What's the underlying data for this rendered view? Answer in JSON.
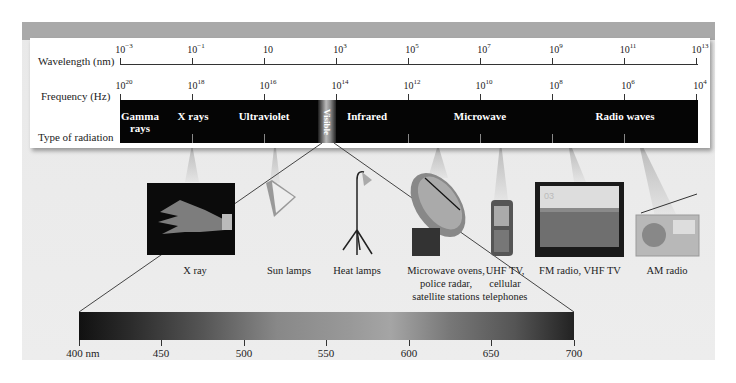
{
  "diagram": {
    "row_labels": {
      "wavelength": "Wavelength (nm)",
      "frequency": "Frequency (Hz)",
      "type": "Type of radiation"
    },
    "wavelength_ticks": [
      {
        "base": "10",
        "exp": "−3"
      },
      {
        "base": "10",
        "exp": "−1"
      },
      {
        "base": "10",
        "exp": ""
      },
      {
        "base": "10",
        "exp": "3"
      },
      {
        "base": "10",
        "exp": "5"
      },
      {
        "base": "10",
        "exp": "7"
      },
      {
        "base": "10",
        "exp": "9"
      },
      {
        "base": "10",
        "exp": "11"
      },
      {
        "base": "10",
        "exp": "13"
      }
    ],
    "frequency_ticks": [
      {
        "base": "10",
        "exp": "20"
      },
      {
        "base": "10",
        "exp": "18"
      },
      {
        "base": "10",
        "exp": "16"
      },
      {
        "base": "10",
        "exp": "14"
      },
      {
        "base": "10",
        "exp": "12"
      },
      {
        "base": "10",
        "exp": "10"
      },
      {
        "base": "10",
        "exp": "8"
      },
      {
        "base": "10",
        "exp": "6"
      },
      {
        "base": "10",
        "exp": "4"
      }
    ],
    "regions": [
      {
        "label_line1": "Gamma",
        "label_line2": "rays"
      },
      {
        "label_line1": "X rays",
        "label_line2": ""
      },
      {
        "label_line1": "Ultraviolet",
        "label_line2": ""
      },
      {
        "label_line1": "Visible",
        "label_line2": ""
      },
      {
        "label_line1": "Infrared",
        "label_line2": ""
      },
      {
        "label_line1": "Microwave",
        "label_line2": ""
      },
      {
        "label_line1": "Radio waves",
        "label_line2": ""
      }
    ],
    "devices": [
      {
        "icon": "xray-hand-icon",
        "line1": "X ray",
        "line2": "",
        "line3": ""
      },
      {
        "icon": "sun-lamp-icon",
        "line1": "Sun lamps",
        "line2": "",
        "line3": ""
      },
      {
        "icon": "heat-lamp-icon",
        "line1": "Heat lamps",
        "line2": "",
        "line3": ""
      },
      {
        "icon": "satellite-dish-icon",
        "line1": "Microwave ovens,",
        "line2": "police radar,",
        "line3": "satellite stations"
      },
      {
        "icon": "cell-phone-icon",
        "line1": "UHF TV,",
        "line2": "cellular",
        "line3": "telephones"
      },
      {
        "icon": "television-icon",
        "line1": "FM radio, VHF TV",
        "line2": "",
        "line3": ""
      },
      {
        "icon": "radio-icon",
        "line1": "AM radio",
        "line2": "",
        "line3": ""
      }
    ],
    "tv_channel": "03",
    "visible_spectrum": {
      "ticks": [
        "400 nm",
        "450",
        "500",
        "550",
        "600",
        "650",
        "700"
      ]
    }
  },
  "colors": {
    "panel_bg": "#ebebeb",
    "top_band": "#a9a9a9",
    "bar": "#050505"
  }
}
